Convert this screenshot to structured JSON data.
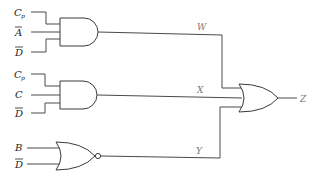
{
  "diagram": {
    "type": "logic-circuit",
    "gates": [
      {
        "id": "and1",
        "kind": "AND",
        "inputs": [
          "C_p",
          "A'",
          "D'"
        ],
        "output": "W"
      },
      {
        "id": "and2",
        "kind": "AND",
        "inputs": [
          "C_p",
          "C",
          "D'"
        ],
        "output": "X"
      },
      {
        "id": "nor1",
        "kind": "NOR",
        "inputs": [
          "B",
          "D'"
        ],
        "output": "Y"
      },
      {
        "id": "or1",
        "kind": "OR",
        "inputs": [
          "W",
          "X",
          "Y"
        ],
        "output": "Z"
      }
    ],
    "inputs": {
      "g1": [
        {
          "main": "C",
          "sub": "p",
          "bar": false
        },
        {
          "main": "A",
          "sub": "",
          "bar": true
        },
        {
          "main": "D",
          "sub": "",
          "bar": true
        }
      ],
      "g2": [
        {
          "main": "C",
          "sub": "p",
          "bar": false
        },
        {
          "main": "C",
          "sub": "",
          "bar": false
        },
        {
          "main": "D",
          "sub": "",
          "bar": true
        }
      ],
      "g3": [
        {
          "main": "B",
          "sub": "",
          "bar": false
        },
        {
          "main": "D",
          "sub": "",
          "bar": true
        }
      ]
    },
    "signals": {
      "w": "W",
      "x": "X",
      "y": "Y",
      "z": "Z"
    }
  }
}
